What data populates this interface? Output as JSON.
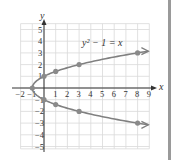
{
  "chart_data": {
    "type": "line",
    "title": "",
    "equation_label": "y² − 1 = x",
    "xlabel": "x",
    "ylabel": "y",
    "xlim": [
      -2,
      9
    ],
    "ylim": [
      -5,
      5
    ],
    "grid": true,
    "x_ticks": [
      "-2",
      "-1",
      "1",
      "2",
      "3",
      "4",
      "5",
      "6",
      "7",
      "8",
      "9"
    ],
    "y_ticks": [
      "5",
      "4",
      "3",
      "2",
      "1",
      "-1",
      "-2",
      "-3",
      "-4",
      "-5"
    ],
    "series": [
      {
        "name": "y² − 1 = x",
        "points": [
          [
            8,
            3
          ],
          [
            3,
            2
          ],
          [
            1,
            1.414
          ],
          [
            0,
            1
          ],
          [
            -1,
            0
          ],
          [
            0,
            -1
          ],
          [
            1,
            -1.414
          ],
          [
            3,
            -2
          ],
          [
            8,
            -3
          ]
        ],
        "marked_points": [
          [
            -1,
            0
          ],
          [
            0,
            1
          ],
          [
            0,
            -1
          ],
          [
            1,
            1.414
          ],
          [
            1,
            -1.414
          ],
          [
            3,
            2
          ],
          [
            3,
            -2
          ],
          [
            8,
            3
          ],
          [
            8,
            -3
          ]
        ],
        "arrows": "both ends (upper and lower branches continue right)"
      }
    ],
    "colors": {
      "curve": "#808080",
      "points": "#8a8a8a",
      "grid": "#d9d9d9",
      "axes": "#333333"
    }
  }
}
